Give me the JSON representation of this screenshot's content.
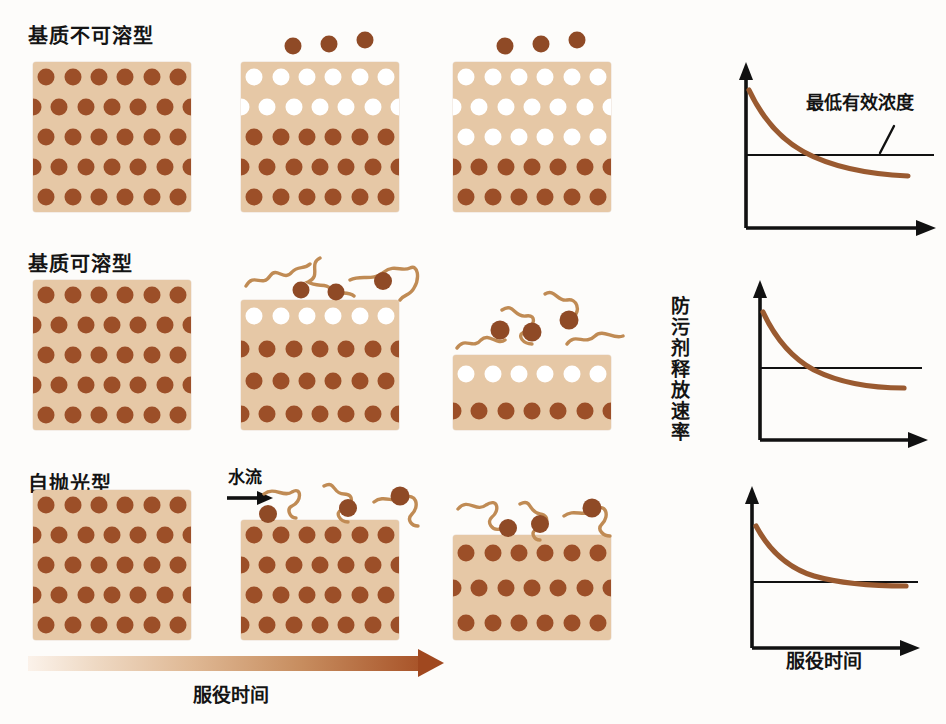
{
  "figure": {
    "title_visible": false,
    "colors": {
      "matrix": "#e6c8a6",
      "biocide_filled": "#9c4f28",
      "biocide_depleted": "#ffffff",
      "polymer_chain": "#c08b54",
      "curve": "#9a5a30",
      "axis": "#111111",
      "time_arrow_start": "#fbf2ea",
      "time_arrow_end": "#a0481f",
      "background": "#fdfcfa"
    }
  },
  "rows": [
    {
      "label": "基质不可溶型",
      "stages": [
        {
          "name": "stage-1",
          "depleted_rows": 0,
          "total_rows": 5,
          "free_particles": 0,
          "chains": 0
        },
        {
          "name": "stage-2",
          "depleted_rows": 2,
          "total_rows": 5,
          "free_particles": 3,
          "chains": 0
        },
        {
          "name": "stage-3",
          "depleted_rows": 3,
          "total_rows": 5,
          "free_particles": 3,
          "chains": 0
        }
      ]
    },
    {
      "label": "基质可溶型",
      "stages": [
        {
          "name": "stage-1",
          "depleted_rows": 0,
          "total_rows": 5,
          "free_particles": 0,
          "chains": 0
        },
        {
          "name": "stage-2",
          "depleted_rows": 1,
          "total_rows": 4,
          "free_particles": 3,
          "chains": 3
        },
        {
          "name": "stage-3",
          "depleted_rows": 1,
          "total_rows": 2,
          "free_particles": 3,
          "chains": 4
        }
      ]
    },
    {
      "label": "自抛光型",
      "stages": [
        {
          "name": "stage-1",
          "depleted_rows": 0,
          "total_rows": 5,
          "free_particles": 0,
          "chains": 0
        },
        {
          "name": "stage-2",
          "depleted_rows": 0,
          "total_rows": 4,
          "free_particles": 3,
          "chains": 3
        },
        {
          "name": "stage-3",
          "depleted_rows": 0,
          "total_rows": 3,
          "free_particles": 3,
          "chains": 3
        }
      ]
    }
  ],
  "water_flow": {
    "label": "水流",
    "arrow": "right-arrow-icon"
  },
  "time_axis": {
    "caption": "服役时间",
    "direction": "left-to-right",
    "meaning": "increasing service time"
  },
  "charts_axis": {
    "y_label": "防污剂释放速率",
    "x_label": "服役时间"
  },
  "annotations": {
    "threshold_label": "最低有效浓度"
  },
  "chart_data": [
    {
      "type": "line",
      "name": "chart-row-1",
      "title": "",
      "xlabel": "服役时间",
      "ylabel": "防污剂释放速率",
      "xlim": [
        0,
        10
      ],
      "ylim": [
        0,
        10
      ],
      "grid": false,
      "legend": "none",
      "series": [
        {
          "name": "release-rate",
          "x": [
            0.2,
            1,
            2,
            3,
            4,
            5,
            6,
            7,
            8,
            8.8
          ],
          "y": [
            8.6,
            6.6,
            5.0,
            4.1,
            3.5,
            3.1,
            2.9,
            2.8,
            2.75,
            2.75
          ]
        }
      ],
      "threshold": {
        "label": "最低有效浓度",
        "y": 4.3,
        "x_from": 0,
        "x_to": 9.6
      },
      "crossing_x": 3.6,
      "annotation_note": "curve falls below minimum effective concentration early"
    },
    {
      "type": "line",
      "name": "chart-row-2",
      "title": "",
      "xlabel": "服役时间",
      "ylabel": "防污剂释放速率",
      "xlim": [
        0,
        10
      ],
      "ylim": [
        0,
        10
      ],
      "grid": false,
      "legend": "none",
      "series": [
        {
          "name": "release-rate",
          "x": [
            0.2,
            1,
            2,
            3,
            4,
            5,
            6,
            7,
            7.8
          ],
          "y": [
            8.4,
            6.8,
            5.4,
            4.6,
            4.05,
            3.75,
            3.6,
            3.55,
            3.55
          ]
        }
      ],
      "threshold": {
        "label": "",
        "y": 4.4,
        "x_from": 0,
        "x_to": 8.6
      },
      "crossing_x": 4.2,
      "annotation_note": "curve settles just below threshold"
    },
    {
      "type": "line",
      "name": "chart-row-3",
      "title": "",
      "xlabel": "服役时间",
      "ylabel": "防污剂释放速率",
      "xlim": [
        0,
        10
      ],
      "ylim": [
        0,
        10
      ],
      "grid": false,
      "legend": "none",
      "series": [
        {
          "name": "release-rate",
          "x": [
            0.2,
            1,
            2,
            3,
            4,
            5,
            6,
            7,
            7.6
          ],
          "y": [
            8.2,
            6.6,
            5.4,
            4.7,
            4.3,
            4.15,
            4.1,
            4.1,
            4.1
          ]
        }
      ],
      "threshold": {
        "label": "",
        "y": 4.25,
        "x_from": 0,
        "x_to": 8.8
      },
      "crossing_x": 5.2,
      "annotation_note": "curve flattens right at the threshold, stays effective"
    }
  ]
}
